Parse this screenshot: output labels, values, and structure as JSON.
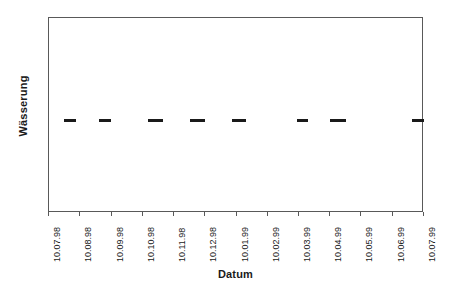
{
  "chart_data": {
    "type": "scatter",
    "title": "",
    "xlabel": "Datum",
    "ylabel": "Wässerung",
    "grid": false,
    "legend": null,
    "categories": [
      "10.07.98",
      "10.08.98",
      "10.09.98",
      "10.10.98",
      "10.11.98",
      "10.12.98",
      "10.01.99",
      "10.02.99",
      "10.03.99",
      "10.04.99",
      "10.05.99",
      "10.06.99",
      "10.07.99"
    ],
    "xlim": [
      "10.07.98",
      "10.07.99"
    ],
    "ylim": [
      0,
      1
    ],
    "yticklabels": [],
    "marker_style": "horizontal-dash",
    "marker_color": "#1a1a1a",
    "frame_color": "#595959",
    "series": [
      {
        "name": "Wässerung",
        "note": "Eight horizontal dash markers, all at the same y level (~0.48 of plot height), of varying widths.",
        "points": [
          {
            "x_frac": 0.041,
            "width_frac": 0.031,
            "y_frac": 0.52
          },
          {
            "x_frac": 0.133,
            "width_frac": 0.031,
            "y_frac": 0.52
          },
          {
            "x_frac": 0.263,
            "width_frac": 0.04,
            "y_frac": 0.52
          },
          {
            "x_frac": 0.376,
            "width_frac": 0.04,
            "y_frac": 0.52
          },
          {
            "x_frac": 0.487,
            "width_frac": 0.037,
            "y_frac": 0.52
          },
          {
            "x_frac": 0.66,
            "width_frac": 0.031,
            "y_frac": 0.52
          },
          {
            "x_frac": 0.748,
            "width_frac": 0.045,
            "y_frac": 0.52
          },
          {
            "x_frac": 0.968,
            "width_frac": 0.032,
            "y_frac": 0.52
          }
        ]
      }
    ]
  },
  "axes": {
    "y_title": "Wässerung",
    "x_title": "Datum"
  },
  "xticks": [
    {
      "label": "10.07.98",
      "pos_frac": 0.0
    },
    {
      "label": "10.08.98",
      "pos_frac": 0.0833
    },
    {
      "label": "10.09.98",
      "pos_frac": 0.1667
    },
    {
      "label": "10.10.98",
      "pos_frac": 0.25
    },
    {
      "label": "10.11.98",
      "pos_frac": 0.3333
    },
    {
      "label": "10.12.98",
      "pos_frac": 0.4167
    },
    {
      "label": "10.01.99",
      "pos_frac": 0.5
    },
    {
      "label": "10.02.99",
      "pos_frac": 0.5833
    },
    {
      "label": "10.03.99",
      "pos_frac": 0.6667
    },
    {
      "label": "10.04.99",
      "pos_frac": 0.75
    },
    {
      "label": "10.05.99",
      "pos_frac": 0.8333
    },
    {
      "label": "10.06.99",
      "pos_frac": 0.9167
    },
    {
      "label": "10.07.99",
      "pos_frac": 1.0
    }
  ]
}
